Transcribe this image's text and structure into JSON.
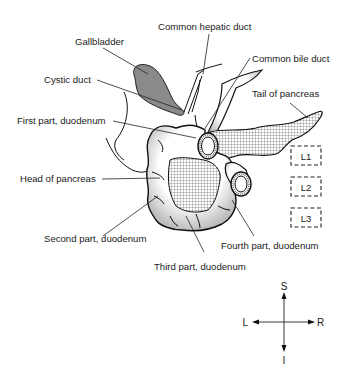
{
  "diagram": {
    "labels": {
      "common_hepatic_duct": "Common hepatic duct",
      "gallbladder": "Gallbladder",
      "common_bile_duct": "Common bile duct",
      "cystic_duct": "Cystic duct",
      "tail_of_pancreas": "Tail of pancreas",
      "first_part_duodenum": "First part, duodenum",
      "head_of_pancreas": "Head of pancreas",
      "second_part_duodenum": "Second part, duodenum",
      "fourth_part_duodenum": "Fourth part, duodenum",
      "third_part_duodenum": "Third part, duodenum"
    },
    "vertebrae": [
      "L1",
      "L2",
      "L3"
    ],
    "orientation": {
      "superior": "S",
      "inferior": "I",
      "left": "L",
      "right": "R"
    },
    "colors": {
      "gallbladder_fill": "#8a8a8a",
      "pancreas_hatch": "#7a7a7a",
      "line": "#111111",
      "text": "#1a1a1a"
    }
  }
}
